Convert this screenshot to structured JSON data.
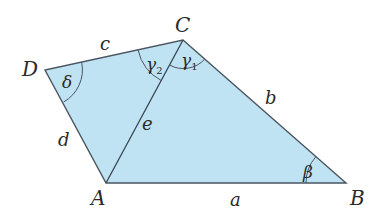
{
  "diagram": {
    "type": "quadrilateral",
    "fill_color": "#bfe3f3",
    "stroke_color": "#4a5560",
    "vertices": [
      {
        "name": "A",
        "x": 106,
        "y": 183
      },
      {
        "name": "B",
        "x": 346,
        "y": 183
      },
      {
        "name": "C",
        "x": 183,
        "y": 40
      },
      {
        "name": "D",
        "x": 45,
        "y": 70
      }
    ],
    "sides": {
      "a": "a",
      "b": "b",
      "c": "c",
      "d": "d",
      "e": "e"
    },
    "angles": {
      "beta": "β",
      "gamma1": "γ",
      "gamma1_sub": "1",
      "gamma2": "γ",
      "gamma2_sub": "2",
      "delta": "δ"
    },
    "vertex_labels": {
      "A": "A",
      "B": "B",
      "C": "C",
      "D": "D"
    }
  }
}
